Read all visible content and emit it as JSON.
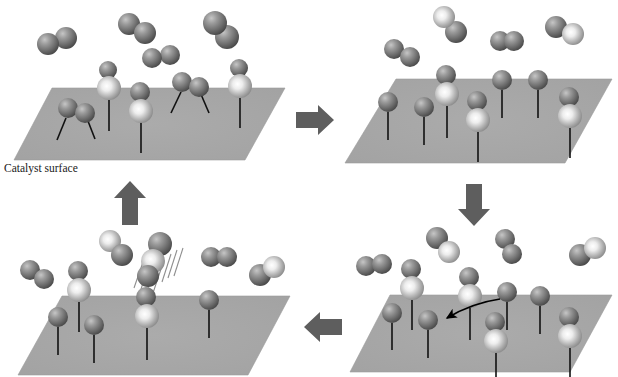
{
  "figure": {
    "type": "four-panel-cycle-diagram",
    "background_color": "#ffffff",
    "surface_label": "Catalyst surface",
    "colors": {
      "surface_plane_fill": "#a8a8a8",
      "surface_plane_edge": "#909090",
      "dark_atom": "#6e6e6e",
      "dark_atom_highlight": "#b9b9b9",
      "dark_atom_shadow": "#4a4a4a",
      "light_atom": "#b0b0b0",
      "light_atom_highlight": "#ffffff",
      "light_atom_shadow": "#7a7a7a",
      "bond_line": "#111111",
      "flow_arrow": "#5e5e5e",
      "motion_line": "#8a8a8a",
      "migration_arrow": "#000000"
    }
  },
  "panels": [
    {
      "id": "panel-1",
      "position": "top-left",
      "name": "adsorption",
      "caption": "Catalyst surface",
      "has_caption": true,
      "plane": {
        "x": 14,
        "y": 88,
        "top_left": 52,
        "top_right": 285,
        "bottom_left": 14,
        "bottom_right": 245,
        "top_y": 88,
        "bottom_y": 160
      },
      "gas_molecules": [
        {
          "name": "h2-gas",
          "x1": 48,
          "y1": 44,
          "x2": 66,
          "y2": 38,
          "r": 11,
          "type": "dark-dark"
        },
        {
          "name": "h2-gas",
          "x1": 129,
          "y1": 24,
          "x2": 145,
          "y2": 33,
          "r": 11,
          "type": "dark-dark"
        },
        {
          "name": "h2-gas",
          "x1": 152,
          "y1": 58,
          "x2": 170,
          "y2": 55,
          "r": 10,
          "type": "dark-dark"
        },
        {
          "name": "h2-gas",
          "x1": 215,
          "y1": 23,
          "x2": 227,
          "y2": 37,
          "r": 12,
          "type": "light-dark"
        }
      ],
      "adsorbed": [
        {
          "name": "adsorbed-dimer-two-legs",
          "style": "horizontal-pair-two-bonds",
          "x": 72,
          "y": 110,
          "r": 10
        },
        {
          "name": "adsorbed-stack",
          "style": "vertical-stack-one-bond",
          "x": 109,
          "y": 72,
          "r_top": 9,
          "r_bottom": 12
        },
        {
          "name": "adsorbed-stack",
          "style": "vertical-stack-one-bond",
          "x": 141,
          "y": 93,
          "r_top": 9,
          "r_bottom": 12
        },
        {
          "name": "adsorbed-dimer-two-legs",
          "style": "horizontal-pair-two-bonds",
          "x": 187,
          "y": 85,
          "r": 10
        },
        {
          "name": "adsorbed-stack",
          "style": "vertical-stack-one-bond",
          "x": 240,
          "y": 70,
          "r_top": 9,
          "r_bottom": 12
        }
      ]
    },
    {
      "id": "panel-2",
      "position": "top-right",
      "name": "dissociation",
      "caption": "",
      "has_caption": false,
      "plane": {
        "top_left": 396,
        "top_right": 612,
        "bottom_left": 345,
        "bottom_right": 565,
        "top_y": 79,
        "bottom_y": 163
      },
      "gas_molecules": [
        {
          "name": "h2-gas",
          "x1": 394,
          "y1": 49,
          "x2": 410,
          "y2": 57,
          "r": 10,
          "type": "dark-dark"
        },
        {
          "name": "h2-gas",
          "x1": 444,
          "y1": 17,
          "x2": 456,
          "y2": 32,
          "r": 11,
          "type": "light-dark"
        },
        {
          "name": "h2-gas",
          "x1": 500,
          "y1": 41,
          "x2": 514,
          "y2": 41,
          "r": 10,
          "type": "dark-dark"
        },
        {
          "name": "h2-gas",
          "x1": 556,
          "y1": 27,
          "x2": 573,
          "y2": 34,
          "r": 11,
          "type": "dark-light"
        }
      ],
      "adsorbed": [
        {
          "name": "adsorbed-atom",
          "style": "single-atom-one-bond",
          "x": 388,
          "y": 102,
          "r": 10
        },
        {
          "name": "adsorbed-atom",
          "style": "single-atom-one-bond",
          "x": 424,
          "y": 107,
          "r": 10
        },
        {
          "name": "adsorbed-stack",
          "style": "vertical-stack-one-bond",
          "x": 447,
          "y": 78,
          "r_top": 9,
          "r_bottom": 12
        },
        {
          "name": "adsorbed-stack",
          "style": "vertical-stack-one-bond",
          "x": 478,
          "y": 104,
          "r_top": 9,
          "r_bottom": 12
        },
        {
          "name": "adsorbed-atom",
          "style": "single-atom-one-bond",
          "x": 502,
          "y": 80,
          "r": 10
        },
        {
          "name": "adsorbed-atom",
          "style": "single-atom-one-bond",
          "x": 538,
          "y": 80,
          "r": 10
        },
        {
          "name": "adsorbed-stack",
          "style": "vertical-stack-one-bond",
          "x": 570,
          "y": 100,
          "r_top": 9,
          "r_bottom": 12
        }
      ]
    },
    {
      "id": "panel-3",
      "position": "bottom-right",
      "name": "surface-migration",
      "caption": "",
      "has_caption": false,
      "has_migration_arrow": true,
      "plane": {
        "top_left": 390,
        "top_right": 612,
        "bottom_left": 350,
        "bottom_right": 570,
        "top_y": 295,
        "bottom_y": 372
      },
      "gas_molecules": [
        {
          "name": "h2-gas",
          "x1": 366,
          "y1": 266,
          "x2": 382,
          "y2": 264,
          "r": 10,
          "type": "dark-dark"
        },
        {
          "name": "h2-gas",
          "x1": 437,
          "y1": 238,
          "x2": 449,
          "y2": 252,
          "r": 11,
          "type": "dark-light"
        },
        {
          "name": "h2-gas",
          "x1": 505,
          "y1": 239,
          "x2": 512,
          "y2": 254,
          "r": 10,
          "type": "dark-dark"
        },
        {
          "name": "h2-gas",
          "x1": 580,
          "y1": 255,
          "x2": 595,
          "y2": 248,
          "r": 11,
          "type": "dark-light"
        }
      ],
      "adsorbed": [
        {
          "name": "adsorbed-atom",
          "style": "single-atom-one-bond",
          "x": 392,
          "y": 313,
          "r": 10
        },
        {
          "name": "adsorbed-stack",
          "style": "vertical-stack-one-bond",
          "x": 412,
          "y": 272,
          "r_top": 9,
          "r_bottom": 12
        },
        {
          "name": "adsorbed-atom",
          "style": "single-atom-one-bond",
          "x": 428,
          "y": 320,
          "r": 10
        },
        {
          "name": "adsorbed-stack",
          "style": "vertical-stack-one-bond",
          "x": 470,
          "y": 280,
          "r_top": 9,
          "r_bottom": 12
        },
        {
          "name": "adsorbed-atom",
          "style": "single-atom-one-bond",
          "x": 507,
          "y": 292,
          "r": 10
        },
        {
          "name": "adsorbed-stack",
          "style": "vertical-stack-one-bond",
          "x": 496,
          "y": 325,
          "r_top": 9,
          "r_bottom": 12
        },
        {
          "name": "adsorbed-atom",
          "style": "single-atom-one-bond",
          "x": 540,
          "y": 296,
          "r": 10
        },
        {
          "name": "adsorbed-stack",
          "style": "vertical-stack-one-bond",
          "x": 570,
          "y": 320,
          "r_top": 9,
          "r_bottom": 12
        }
      ],
      "migration_arrow": {
        "from_x": 500,
        "from_y": 300,
        "to_x": 445,
        "to_y": 320
      }
    },
    {
      "id": "panel-4",
      "position": "bottom-left",
      "name": "desorption",
      "caption": "",
      "has_caption": false,
      "has_motion_lines": true,
      "plane": {
        "top_left": 62,
        "top_right": 290,
        "bottom_left": 18,
        "bottom_right": 248,
        "top_y": 296,
        "bottom_y": 375
      },
      "gas_molecules": [
        {
          "name": "h2-gas",
          "x1": 30,
          "y1": 270,
          "x2": 44,
          "y2": 279,
          "r": 10,
          "type": "dark-dark"
        },
        {
          "name": "h2-gas",
          "x1": 110,
          "y1": 241,
          "x2": 122,
          "y2": 255,
          "r": 11,
          "type": "light-dark"
        },
        {
          "name": "h2-gas",
          "x1": 211,
          "y1": 257,
          "x2": 227,
          "y2": 257,
          "r": 10,
          "type": "dark-dark"
        },
        {
          "name": "h2-gas",
          "x1": 260,
          "y1": 275,
          "x2": 274,
          "y2": 267,
          "r": 11,
          "type": "dark-light"
        },
        {
          "name": "h2-desorbing",
          "x1": 158,
          "y1": 244,
          "x2": 152,
          "y2": 263,
          "r": 12,
          "type": "light-dark",
          "motion": true
        }
      ],
      "adsorbed": [
        {
          "name": "adsorbed-stack",
          "style": "vertical-stack-one-bond",
          "x": 79,
          "y": 274,
          "r_top": 9,
          "r_bottom": 12
        },
        {
          "name": "adsorbed-atom",
          "style": "single-atom-one-bond",
          "x": 58,
          "y": 317,
          "r": 10
        },
        {
          "name": "adsorbed-atom",
          "style": "single-atom-one-bond",
          "x": 94,
          "y": 325,
          "r": 10
        },
        {
          "name": "adsorbed-stack",
          "style": "vertical-stack-one-bond",
          "x": 147,
          "y": 300,
          "r_top": 9,
          "r_bottom": 12
        },
        {
          "name": "adsorbed-atom",
          "style": "single-atom-one-bond",
          "x": 209,
          "y": 300,
          "r": 10
        }
      ]
    }
  ],
  "flow_arrows": [
    {
      "name": "flow-arrow-right-top",
      "direction": "right",
      "cx": 313,
      "cy": 120,
      "label": ""
    },
    {
      "name": "flow-arrow-down-right",
      "direction": "down",
      "cx": 474,
      "cy": 205,
      "label": ""
    },
    {
      "name": "flow-arrow-left-bottom",
      "direction": "left",
      "cx": 319,
      "cy": 327,
      "label": ""
    },
    {
      "name": "flow-arrow-up-left",
      "direction": "up",
      "cx": 130,
      "cy": 203,
      "label": ""
    }
  ],
  "legend": {
    "dark_sphere_meaning": "hydrogen atom",
    "light_sphere_meaning": "substrate / metal atom"
  }
}
